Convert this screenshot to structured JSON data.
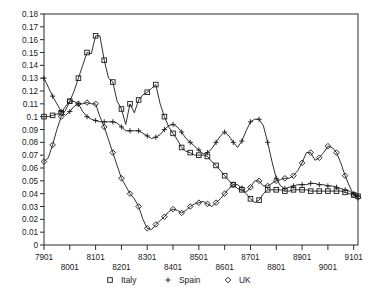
{
  "chart_data": {
    "type": "line",
    "title": "",
    "subtitle": "",
    "xlabel": "",
    "ylabel": "",
    "grid": false,
    "legend_position": "bottom-center",
    "ylim": [
      0,
      0.18
    ],
    "ytick_labels": [
      "0",
      "0.01",
      "0.02",
      "0.03",
      "0.04",
      "0.05",
      "0.06",
      "0.07",
      "0.08",
      "0.09",
      "0.1",
      "0.11",
      "0.12",
      "0.13",
      "0.14",
      "0.15",
      "0.16",
      "0.17",
      "0.18"
    ],
    "ytick_values": [
      0,
      0.01,
      0.02,
      0.03,
      0.04,
      0.05,
      0.06,
      0.07,
      0.08,
      0.09,
      0.1,
      0.11,
      0.12,
      0.13,
      0.14,
      0.15,
      0.16,
      0.17,
      0.18
    ],
    "xtick_labels": [
      "7901",
      "8001",
      "8101",
      "8201",
      "8301",
      "8401",
      "8501",
      "8601",
      "8701",
      "8801",
      "8901",
      "9001",
      "9101"
    ],
    "xtick_values": [
      7901,
      8001,
      8101,
      8201,
      8301,
      8401,
      8501,
      8601,
      8701,
      8801,
      8901,
      9001,
      9101
    ],
    "x": [
      7901,
      7903,
      7905,
      7907,
      7909,
      7911,
      8001,
      8003,
      8005,
      8007,
      8009,
      8011,
      8101,
      8103,
      8105,
      8107,
      8109,
      8111,
      8201,
      8203,
      8205,
      8207,
      8209,
      8211,
      8301,
      8303,
      8305,
      8307,
      8309,
      8311,
      8401,
      8403,
      8405,
      8407,
      8409,
      8411,
      8501,
      8503,
      8505,
      8507,
      8509,
      8511,
      8601,
      8603,
      8605,
      8607,
      8609,
      8611,
      8701,
      8703,
      8705,
      8707,
      8709,
      8711,
      8801,
      8803,
      8805,
      8807,
      8809,
      8811,
      8901,
      8903,
      8905,
      8907,
      8909,
      8911,
      9001,
      9003,
      9005,
      9007,
      9009,
      9011,
      9101,
      9103
    ],
    "series": [
      {
        "name": "Italy",
        "marker": "square",
        "values": [
          0.1,
          0.1,
          0.101,
          0.102,
          0.103,
          0.108,
          0.112,
          0.12,
          0.13,
          0.14,
          0.15,
          0.149,
          0.163,
          0.163,
          0.144,
          0.13,
          0.127,
          0.112,
          0.106,
          0.094,
          0.11,
          0.103,
          0.113,
          0.117,
          0.119,
          0.122,
          0.125,
          0.11,
          0.1,
          0.092,
          0.087,
          0.082,
          0.076,
          0.073,
          0.072,
          0.07,
          0.07,
          0.07,
          0.069,
          0.065,
          0.062,
          0.058,
          0.054,
          0.05,
          0.047,
          0.044,
          0.043,
          0.04,
          0.036,
          0.033,
          0.035,
          0.04,
          0.043,
          0.043,
          0.043,
          0.043,
          0.042,
          0.042,
          0.043,
          0.043,
          0.043,
          0.043,
          0.042,
          0.042,
          0.042,
          0.042,
          0.042,
          0.042,
          0.042,
          0.042,
          0.041,
          0.04,
          0.039,
          0.038
        ]
      },
      {
        "name": "Spain",
        "marker": "plus",
        "values": [
          0.13,
          0.123,
          0.116,
          0.11,
          0.104,
          0.101,
          0.104,
          0.108,
          0.11,
          0.104,
          0.1,
          0.098,
          0.097,
          0.096,
          0.096,
          0.096,
          0.096,
          0.095,
          0.092,
          0.089,
          0.089,
          0.089,
          0.089,
          0.087,
          0.085,
          0.083,
          0.084,
          0.086,
          0.09,
          0.093,
          0.094,
          0.092,
          0.088,
          0.083,
          0.08,
          0.077,
          0.074,
          0.071,
          0.072,
          0.075,
          0.08,
          0.085,
          0.088,
          0.085,
          0.08,
          0.076,
          0.081,
          0.089,
          0.096,
          0.098,
          0.098,
          0.093,
          0.08,
          0.065,
          0.052,
          0.046,
          0.044,
          0.045,
          0.046,
          0.047,
          0.047,
          0.047,
          0.048,
          0.048,
          0.047,
          0.047,
          0.046,
          0.046,
          0.045,
          0.044,
          0.043,
          0.042,
          0.04,
          0.038
        ]
      },
      {
        "name": "UK",
        "marker": "diamond",
        "values": [
          0.065,
          0.068,
          0.078,
          0.09,
          0.1,
          0.105,
          0.112,
          0.112,
          0.11,
          0.11,
          0.111,
          0.11,
          0.11,
          0.1,
          0.092,
          0.082,
          0.072,
          0.062,
          0.052,
          0.046,
          0.04,
          0.036,
          0.03,
          0.02,
          0.013,
          0.012,
          0.016,
          0.019,
          0.022,
          0.026,
          0.028,
          0.027,
          0.025,
          0.027,
          0.03,
          0.032,
          0.033,
          0.034,
          0.032,
          0.03,
          0.033,
          0.036,
          0.04,
          0.044,
          0.047,
          0.047,
          0.044,
          0.041,
          0.045,
          0.05,
          0.05,
          0.046,
          0.046,
          0.048,
          0.05,
          0.051,
          0.052,
          0.052,
          0.054,
          0.058,
          0.064,
          0.072,
          0.072,
          0.066,
          0.068,
          0.072,
          0.077,
          0.076,
          0.072,
          0.064,
          0.054,
          0.046,
          0.039,
          0.037
        ]
      }
    ]
  },
  "legend": {
    "entries": [
      {
        "label": "Italy",
        "marker": "square"
      },
      {
        "label": "Spain",
        "marker": "plus"
      },
      {
        "label": "UK",
        "marker": "diamond"
      }
    ]
  }
}
